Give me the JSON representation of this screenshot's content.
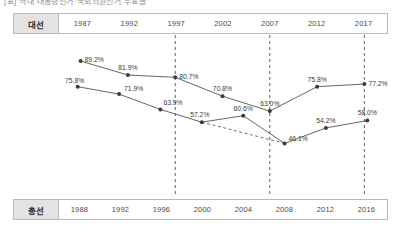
{
  "caption": {
    "text": "[표] 역대 대통령선거·국회의원선거 투표율"
  },
  "axes": {
    "presidential": {
      "label": "대선",
      "years": [
        "1987",
        "1992",
        "1997",
        "2002",
        "2007",
        "2012",
        "2017"
      ]
    },
    "general": {
      "label": "총선",
      "years": [
        "1988",
        "1992",
        "1996",
        "2000",
        "2004",
        "2008",
        "2012",
        "2016"
      ]
    }
  },
  "colors": {
    "line": "#555555",
    "marker": "#3a3a3a",
    "guide": "#4a4a4a",
    "header_fill": "#e3e3e3",
    "border": "#b9b9b9",
    "text": "#3a3a3a"
  },
  "guides": {
    "years": [
      "1997",
      "2007",
      "2017"
    ]
  },
  "chart_data": {
    "type": "line",
    "title": "역대 대통령선거·국회의원선거 투표율",
    "xlabel": "",
    "ylabel": "투표율(%)",
    "ylim": [
      40,
      95
    ],
    "grid": false,
    "legend": "none",
    "annotations": [
      "dashed vertical guide lines at 1997, 2007 and 2017",
      "dashed trend segment on 총선 series between 2000 (57.2%) and 2008 (46.1%)"
    ],
    "series": [
      {
        "name": "대선",
        "x": [
          "1987",
          "1992",
          "1997",
          "2002",
          "2007",
          "2012",
          "2017"
        ],
        "values": [
          89.2,
          81.9,
          80.7,
          70.8,
          63.0,
          75.8,
          77.2
        ],
        "labels": [
          "89.2%",
          "81.9%",
          "80.7%",
          "70.8%",
          "63.0%",
          "75.8%",
          "77.2%"
        ]
      },
      {
        "name": "총선",
        "x": [
          "1988",
          "1992",
          "1996",
          "2000",
          "2004",
          "2008",
          "2012",
          "2016"
        ],
        "values": [
          75.8,
          71.9,
          63.9,
          57.2,
          60.6,
          46.1,
          54.2,
          58.0
        ],
        "labels": [
          "75.8%",
          "71.9%",
          "63.9%",
          "57.2%",
          "60.6%",
          "46.1%",
          "54.2%",
          "58.0%"
        ]
      }
    ]
  }
}
